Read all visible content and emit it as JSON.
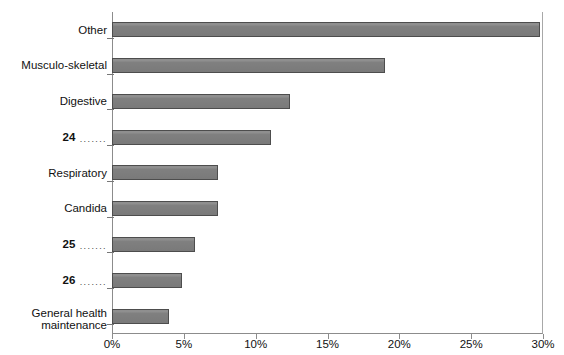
{
  "chart_data": {
    "type": "bar",
    "orientation": "horizontal",
    "title": "",
    "xlabel": "",
    "ylabel": "",
    "xlim": [
      0,
      30
    ],
    "xtick_labels": [
      "0%",
      "5%",
      "10%",
      "15%",
      "20%",
      "25%",
      "30%"
    ],
    "xtick_values": [
      0,
      5,
      10,
      15,
      20,
      25,
      30
    ],
    "grid": false,
    "legend": false,
    "bar_color": "#808080",
    "bar_border_color": "#4d4d4d",
    "axis_color": "#8c8c8c",
    "categories": [
      "Other",
      "Musculo-skeletal",
      "Digestive",
      "24",
      "Respiratory",
      "Candida",
      "25",
      "26",
      "General health\nmaintenance"
    ],
    "values": [
      29.8,
      19.0,
      12.4,
      11.1,
      7.4,
      7.4,
      5.8,
      4.9,
      4.0
    ],
    "bars": [
      {
        "label": "Other",
        "value": 29.8,
        "numbered": false,
        "leader": ""
      },
      {
        "label": "Musculo-skeletal",
        "value": 19.0,
        "numbered": false,
        "leader": ""
      },
      {
        "label": "Digestive",
        "value": 12.4,
        "numbered": false,
        "leader": ""
      },
      {
        "label": "24",
        "value": 11.1,
        "numbered": true,
        "leader": "......."
      },
      {
        "label": "Respiratory",
        "value": 7.4,
        "numbered": false,
        "leader": ""
      },
      {
        "label": "Candida",
        "value": 7.4,
        "numbered": false,
        "leader": ""
      },
      {
        "label": "25",
        "value": 5.8,
        "numbered": true,
        "leader": "......."
      },
      {
        "label": "26",
        "value": 4.9,
        "numbered": true,
        "leader": "......."
      },
      {
        "label": "General health\nmaintenance",
        "value": 4.0,
        "numbered": false,
        "leader": ""
      }
    ]
  }
}
